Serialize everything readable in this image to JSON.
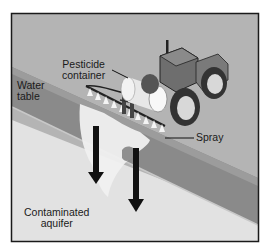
{
  "figure": {
    "labels": {
      "pesticide_container": [
        "Pesticide",
        "container"
      ],
      "water_table": [
        "Water",
        "table"
      ],
      "spray": "Spray",
      "contaminated_aquifer": [
        "Contaminated",
        "aquifer"
      ]
    },
    "colors": {
      "surface": "#b4b4b4",
      "soil_band": "#8a8a8a",
      "soil_band_dark": "#777777",
      "aquifer": "#e2e2e2",
      "plume": "#f2f2f2",
      "plume_shadow": "#9a9a9a",
      "frame": "#1a1a1a",
      "arrow": "#111111",
      "tractor_body": "#7d7d7d",
      "tank": "#eeeeee"
    },
    "icons": [
      "tractor-icon",
      "pesticide-tank-icon",
      "spray-boom-icon",
      "down-arrow-icon"
    ]
  }
}
